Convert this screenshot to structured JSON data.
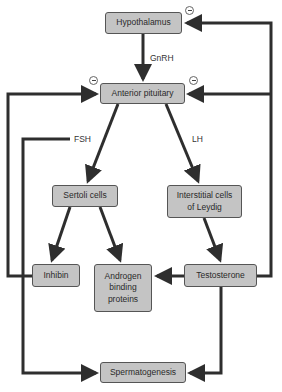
{
  "diagram": {
    "nodes": {
      "hypothalamus": "Hypothalamus",
      "anterior_pituitary": "Anterior pituitary",
      "sertoli": "Sertoli cells",
      "leydig": "Interstitial cells of Leydig",
      "inhibin": "Inhibin",
      "abp": "Androgen binding proteins",
      "testosterone": "Testosterone",
      "spermatogenesis": "Spermatogenesis"
    },
    "edge_labels": {
      "gnrh": "GnRH",
      "fsh": "FSH",
      "lh": "LH"
    },
    "feedback_symbol": "minus-sign",
    "colors": {
      "box_fill": "#c4c4c4",
      "arrow": "#2e2e2e"
    }
  }
}
